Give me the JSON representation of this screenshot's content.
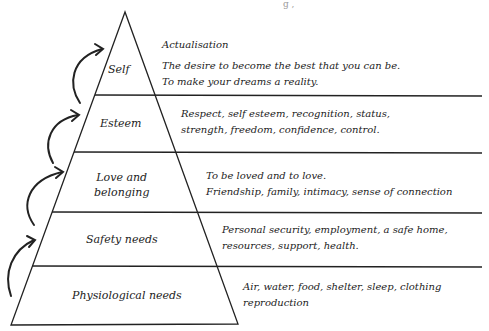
{
  "title_fragment": "g ,",
  "levels": [
    {
      "label": "Self",
      "heading": "Actualisation",
      "description": [
        "The desire to become the best that you can be.",
        "To make your dreams a reality."
      ]
    },
    {
      "label": "Esteem",
      "description": [
        "Respect, self esteem, recognition, status,",
        "strength, freedom, confidence, control."
      ]
    },
    {
      "label_lines": [
        "Love and",
        "belonging"
      ],
      "description": [
        "To be loved and to love.",
        "Friendship, family, intimacy, sense of connection"
      ]
    },
    {
      "label": "Safety needs",
      "description": [
        "Personal security, employment, a safe home,",
        "resources, support, health."
      ]
    },
    {
      "label": "Physiological needs",
      "description": [
        "Air, water, food, shelter, sleep, clothing",
        "reproduction"
      ]
    }
  ],
  "colors": {
    "ink": "#222222",
    "background": "#ffffff"
  }
}
